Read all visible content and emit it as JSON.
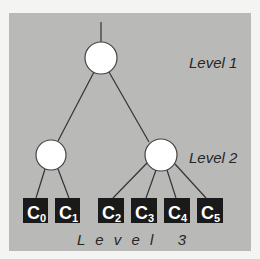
{
  "diagram": {
    "type": "tree",
    "levels": [
      {
        "label": "Level 1",
        "nodes": [
          "root"
        ]
      },
      {
        "label": "Level 2",
        "nodes": [
          "left-internal",
          "right-internal"
        ]
      },
      {
        "label": "Level 3",
        "nodes": [
          "C0",
          "C1",
          "C2",
          "C3",
          "C4",
          "C5"
        ]
      }
    ],
    "level_labels": {
      "level1": "Level 1",
      "level2": "Level 2",
      "level3": "L e v e l   3"
    },
    "leaves": [
      {
        "base": "C",
        "sub": "0"
      },
      {
        "base": "C",
        "sub": "1"
      },
      {
        "base": "C",
        "sub": "2"
      },
      {
        "base": "C",
        "sub": "3"
      },
      {
        "base": "C",
        "sub": "4"
      },
      {
        "base": "C",
        "sub": "5"
      }
    ],
    "edges": [
      [
        "root",
        "left-internal"
      ],
      [
        "root",
        "right-internal"
      ],
      [
        "left-internal",
        "C0"
      ],
      [
        "left-internal",
        "C1"
      ],
      [
        "right-internal",
        "C2"
      ],
      [
        "right-internal",
        "C3"
      ],
      [
        "right-internal",
        "C4"
      ],
      [
        "right-internal",
        "C5"
      ]
    ],
    "colors": {
      "panel": "#b9b9b7",
      "node_fill": "#ffffff",
      "leaf_fill": "#1a1a1a",
      "line": "#333333"
    }
  }
}
